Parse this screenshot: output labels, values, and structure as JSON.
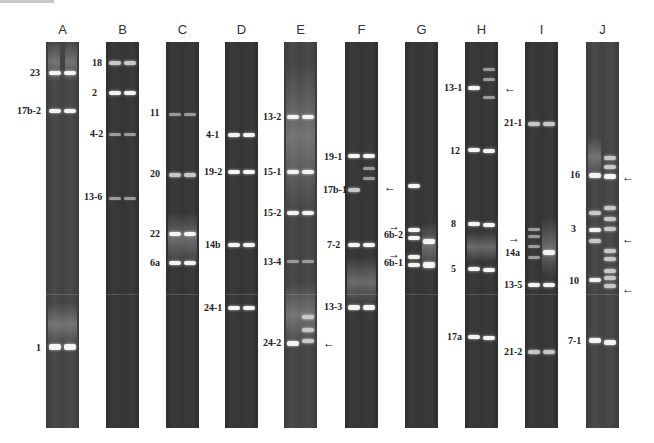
{
  "figure": {
    "panels": [
      {
        "letter": "A",
        "labels": [
          {
            "text": "23",
            "y": 72
          },
          {
            "text": "17b-2",
            "y": 110
          },
          {
            "text": "1",
            "y": 347
          }
        ]
      },
      {
        "letter": "B",
        "labels": [
          {
            "text": "18",
            "y": 62
          },
          {
            "text": "2",
            "y": 92
          },
          {
            "text": "4-2",
            "y": 133
          },
          {
            "text": "13-6",
            "y": 196
          }
        ]
      },
      {
        "letter": "C",
        "labels": [
          {
            "text": "11",
            "y": 112
          },
          {
            "text": "20",
            "y": 173
          },
          {
            "text": "22",
            "y": 233
          },
          {
            "text": "6a",
            "y": 262
          }
        ]
      },
      {
        "letter": "D",
        "labels": [
          {
            "text": "4-1",
            "y": 134
          },
          {
            "text": "19-2",
            "y": 171
          },
          {
            "text": "14b",
            "y": 244
          },
          {
            "text": "24-1",
            "y": 307
          }
        ]
      },
      {
        "letter": "E",
        "labels": [
          {
            "text": "13-2",
            "y": 116
          },
          {
            "text": "15-1",
            "y": 171
          },
          {
            "text": "15-2",
            "y": 212
          },
          {
            "text": "13-4",
            "y": 261
          },
          {
            "text": "24-2",
            "y": 342
          }
        ]
      },
      {
        "letter": "F",
        "labels": [
          {
            "text": "19-1",
            "y": 156
          },
          {
            "text": "17b-1",
            "y": 189
          },
          {
            "text": "7-2",
            "y": 244
          },
          {
            "text": "13-3",
            "y": 306
          }
        ]
      },
      {
        "letter": "G",
        "labels": [
          {
            "text": "6b-2",
            "y": 234
          },
          {
            "text": "6b-1",
            "y": 262
          }
        ]
      },
      {
        "letter": "H",
        "labels": [
          {
            "text": "13-1",
            "y": 87
          },
          {
            "text": "12",
            "y": 150
          },
          {
            "text": "8",
            "y": 223
          },
          {
            "text": "5",
            "y": 268
          },
          {
            "text": "17a",
            "y": 336
          }
        ]
      },
      {
        "letter": "I",
        "labels": [
          {
            "text": "21-1",
            "y": 122
          },
          {
            "text": "14a",
            "y": 252
          },
          {
            "text": "13-5",
            "y": 284
          },
          {
            "text": "21-2",
            "y": 351
          }
        ]
      },
      {
        "letter": "J",
        "labels": [
          {
            "text": "16",
            "y": 174
          },
          {
            "text": "3",
            "y": 228
          },
          {
            "text": "10",
            "y": 280
          },
          {
            "text": "7-1",
            "y": 340
          }
        ]
      }
    ],
    "arrows": [
      {
        "panel": "E",
        "direction": "left",
        "near_label": "24-2"
      },
      {
        "panel": "F",
        "direction": "left",
        "near_label": "17b-1"
      },
      {
        "panel": "G",
        "direction": "right",
        "near_label": "6b-2"
      },
      {
        "panel": "G",
        "direction": "right",
        "near_label": "6b-1"
      },
      {
        "panel": "H",
        "direction": "left",
        "near_label": "13-1"
      },
      {
        "panel": "I",
        "direction": "right",
        "near_label": "14a"
      },
      {
        "panel": "J",
        "direction": "left",
        "near_label": "16"
      },
      {
        "panel": "J",
        "direction": "left",
        "near_label": "3"
      },
      {
        "panel": "J",
        "direction": "left",
        "near_label": "10"
      }
    ],
    "glyphs": {
      "arrow_left": "←",
      "arrow_right": "→"
    }
  }
}
